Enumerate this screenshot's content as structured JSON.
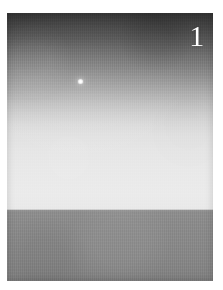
{
  "plate": {
    "number_label": "1",
    "caption": "",
    "subject": "horizon-with-light-source",
    "medium": "black-and-white-photograph"
  },
  "canvas": {
    "width": 223,
    "height": 290,
    "background_color": "#ffffff",
    "margin_left": 7,
    "margin_top": 13,
    "photo_width": 206,
    "photo_height": 268
  },
  "photo": {
    "sky": {
      "name": "sky-gradient",
      "top_color": "#343434",
      "upper_mid_color": "#6e6e6e",
      "lower_mid_color": "#b0b0b0",
      "horizon_color": "#ececec",
      "height_percent": 73.5
    },
    "ground": {
      "name": "ground-plane",
      "top_color": "#8f8f8f",
      "bottom_color": "#7e7e7e",
      "height_percent": 26.5
    },
    "horizon": {
      "name": "horizon-line",
      "y_percent": 73.5,
      "y_pixels": 210,
      "color": "#bebebe"
    },
    "light_point": {
      "name": "light-source",
      "x_percent": 35.0,
      "y_percent": 25.0,
      "x_pixels": 79,
      "y_pixels": 80,
      "diameter_px": 3,
      "color": "#ffffff"
    },
    "number": {
      "x_percent": 88.5,
      "y_percent": 3.0,
      "color": "#ffffff",
      "font_size_px": 30
    }
  }
}
